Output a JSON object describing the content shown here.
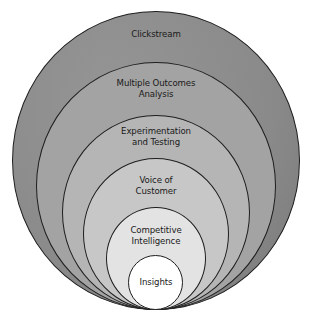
{
  "diagram": {
    "type": "nested-circles",
    "layers": [
      {
        "label_lines": [
          "Clickstream"
        ],
        "fill": "#8c8c8c"
      },
      {
        "label_lines": [
          "Multiple Outcomes",
          "Analysis"
        ],
        "fill": "#a2a2a2"
      },
      {
        "label_lines": [
          "Experimentation",
          "and Testing"
        ],
        "fill": "#b5b5b5"
      },
      {
        "label_lines": [
          "Voice of",
          "Customer"
        ],
        "fill": "#c6c6c6"
      },
      {
        "label_lines": [
          "Competitive",
          "Intelligence"
        ],
        "fill": "#e3e3e3"
      },
      {
        "label_lines": [
          "Insights"
        ],
        "fill": "#ffffff"
      }
    ]
  }
}
